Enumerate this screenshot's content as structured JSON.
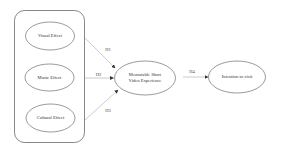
{
  "diagram": {
    "type": "research-model",
    "group": {
      "label": "",
      "members": [
        "Visual Effect",
        "Music Effect",
        "Cultural Effect"
      ]
    },
    "nodes": [
      {
        "id": "visual",
        "label": "Visual Effect"
      },
      {
        "id": "music",
        "label": "Music Effect"
      },
      {
        "id": "cultural",
        "label": "Cultural Effect"
      },
      {
        "id": "msve",
        "label_line1": "Memorable Short",
        "label_line2": "Video Experience"
      },
      {
        "id": "intention",
        "label": "Intention to visit"
      }
    ],
    "edges": [
      {
        "from": "visual",
        "to": "msve",
        "label": "H1"
      },
      {
        "from": "music",
        "to": "msve",
        "label": "H2"
      },
      {
        "from": "cultural",
        "to": "msve",
        "label": "H3"
      },
      {
        "from": "msve",
        "to": "intention",
        "label": "H4"
      }
    ],
    "colors": {
      "stroke": "#555555",
      "arrow": "#999999",
      "text": "#333333",
      "background": "#ffffff"
    }
  }
}
